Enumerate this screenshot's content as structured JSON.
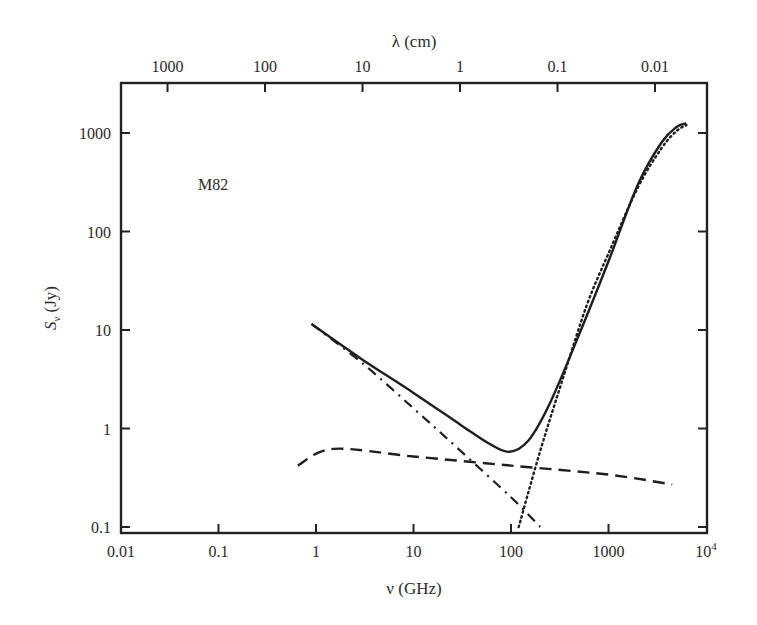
{
  "chart_data": {
    "type": "line",
    "title": "",
    "annotation": "M82",
    "xlabel": "ν (GHz)",
    "ylabel": "S_ν (Jy)",
    "x2label": "λ (cm)",
    "xscale": "log",
    "yscale": "log",
    "xlim": [
      0.01,
      10000
    ],
    "ylim": [
      0.1,
      3162
    ],
    "grid": false,
    "legend": "none",
    "xticks": [
      {
        "value": 0.01,
        "label": "0.01"
      },
      {
        "value": 0.1,
        "label": "0.1"
      },
      {
        "value": 1,
        "label": "1"
      },
      {
        "value": 10,
        "label": "10"
      },
      {
        "value": 100,
        "label": "100"
      },
      {
        "value": 1000,
        "label": "1000"
      },
      {
        "value": 10000,
        "label": "10",
        "sup": "4"
      }
    ],
    "yticks": [
      {
        "value": 0.1,
        "label": "0.1"
      },
      {
        "value": 1,
        "label": "1"
      },
      {
        "value": 10,
        "label": "10"
      },
      {
        "value": 100,
        "label": "100"
      },
      {
        "value": 1000,
        "label": "1000"
      }
    ],
    "x2ticks": [
      {
        "lambda_cm": 1000,
        "label": "1000"
      },
      {
        "lambda_cm": 100,
        "label": "100"
      },
      {
        "lambda_cm": 10,
        "label": "10"
      },
      {
        "lambda_cm": 1,
        "label": "1"
      },
      {
        "lambda_cm": 0.1,
        "label": "0.1"
      },
      {
        "lambda_cm": 0.01,
        "label": "0.01"
      }
    ],
    "series": [
      {
        "name": "total",
        "style": "solid",
        "x": [
          0.9,
          3,
          10,
          30,
          60,
          96,
          150,
          250,
          500,
          1000,
          2000,
          3500,
          5000,
          6300
        ],
        "y": [
          11.5,
          5.0,
          2.3,
          1.1,
          0.7,
          0.58,
          0.75,
          1.8,
          9,
          50,
          300,
          800,
          1150,
          1250
        ]
      },
      {
        "name": "synchrotron",
        "style": "dashdot",
        "x": [
          0.9,
          3,
          10,
          30,
          100,
          200
        ],
        "y": [
          11.5,
          4.6,
          1.6,
          0.6,
          0.2,
          0.1
        ]
      },
      {
        "name": "free-free",
        "style": "dashed",
        "x": [
          0.65,
          1.5,
          10,
          100,
          1000,
          4500
        ],
        "y": [
          0.42,
          0.62,
          0.52,
          0.42,
          0.34,
          0.27
        ]
      },
      {
        "name": "dust",
        "style": "dotted",
        "x": [
          120,
          200,
          350,
          600,
          1000,
          2000,
          3500,
          5000,
          6300
        ],
        "y": [
          0.1,
          0.6,
          3.5,
          18,
          60,
          280,
          700,
          1050,
          1200
        ]
      }
    ]
  }
}
